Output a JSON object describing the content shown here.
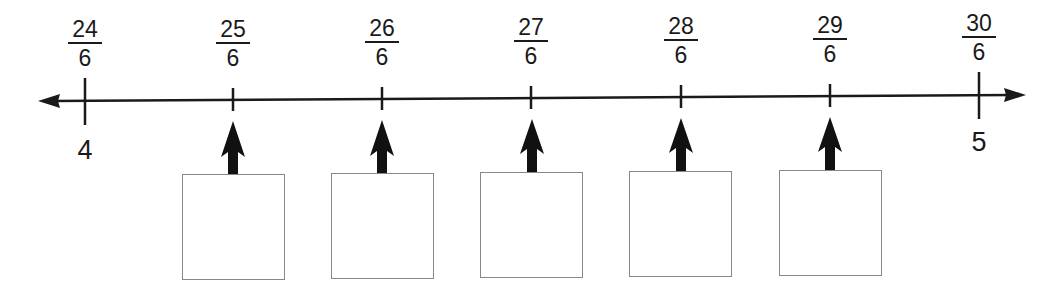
{
  "number_line": {
    "start_whole": "4",
    "end_whole": "5",
    "ticks": [
      {
        "numerator": "24",
        "denominator": "6"
      },
      {
        "numerator": "25",
        "denominator": "6"
      },
      {
        "numerator": "26",
        "denominator": "6"
      },
      {
        "numerator": "27",
        "denominator": "6"
      },
      {
        "numerator": "28",
        "denominator": "6"
      },
      {
        "numerator": "29",
        "denominator": "6"
      },
      {
        "numerator": "30",
        "denominator": "6"
      }
    ],
    "answer_boxes": [
      {
        "points_to": "25/6",
        "value": ""
      },
      {
        "points_to": "26/6",
        "value": ""
      },
      {
        "points_to": "27/6",
        "value": ""
      },
      {
        "points_to": "28/6",
        "value": ""
      },
      {
        "points_to": "29/6",
        "value": ""
      }
    ]
  }
}
